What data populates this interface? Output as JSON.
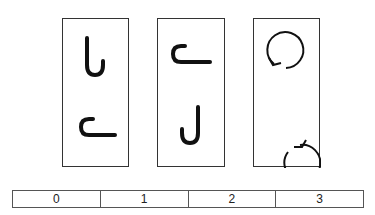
{
  "title": {
    "text": ""
  },
  "panels": [
    {
      "id": "panel-1",
      "left": 62,
      "width": 67,
      "figures": [
        {
          "name": "vertical-hook-right-icon",
          "shape": "hook",
          "orientation": "opening-up-hook-right"
        },
        {
          "name": "horizontal-hook-icon",
          "shape": "hook",
          "orientation": "horizontal-c-long-bottom"
        }
      ]
    },
    {
      "id": "panel-2",
      "left": 157,
      "width": 68,
      "figures": [
        {
          "name": "horizontal-hook-icon",
          "shape": "hook",
          "orientation": "horizontal-c-long-bottom"
        },
        {
          "name": "j-hook-icon",
          "shape": "hook",
          "orientation": "j-shape"
        }
      ]
    },
    {
      "id": "panel-3",
      "left": 253,
      "width": 67,
      "figures": [
        {
          "name": "circle-arrow-counterclockwise-icon",
          "shape": "circle-arrow",
          "arrow_position": "lower-left"
        },
        {
          "name": "circle-arrow-clockwise-icon",
          "shape": "circle-arrow",
          "arrow_position": "lower-right"
        }
      ]
    }
  ],
  "answer_options": [
    "0",
    "1",
    "2",
    "3"
  ],
  "colors": {
    "stroke": "#111111",
    "border": "#333333",
    "background": "#ffffff"
  }
}
